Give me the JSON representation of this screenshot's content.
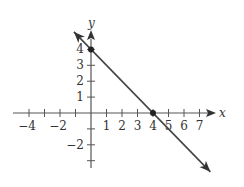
{
  "chart_data": {
    "type": "line",
    "title": "",
    "xlabel": "x",
    "ylabel": "y",
    "xlim": [
      -5.1,
      8
    ],
    "ylim": [
      -3.5,
      5.2
    ],
    "grid": false,
    "legend": "none",
    "x_ticks": [
      -4,
      -3,
      -2,
      -1,
      1,
      2,
      3,
      4,
      5,
      6,
      7
    ],
    "x_tick_labels": [
      {
        "value": -4,
        "label": "−4"
      },
      {
        "value": -2,
        "label": "−2"
      },
      {
        "value": 1,
        "label": "1"
      },
      {
        "value": 2,
        "label": "2"
      },
      {
        "value": 3,
        "label": "3"
      },
      {
        "value": 4,
        "label": "4"
      },
      {
        "value": 5,
        "label": "5"
      },
      {
        "value": 6,
        "label": "6"
      },
      {
        "value": 7,
        "label": "7"
      }
    ],
    "y_ticks": [
      -3,
      -2,
      -1,
      1,
      2,
      3,
      4
    ],
    "y_tick_labels": [
      {
        "value": 4,
        "label": "4"
      },
      {
        "value": 3,
        "label": "3"
      },
      {
        "value": 2,
        "label": "2"
      },
      {
        "value": 1,
        "label": "1"
      },
      {
        "value": -2,
        "label": "−2"
      }
    ],
    "series": [
      {
        "name": "line",
        "equation": "y = -x + 4",
        "x": [
          -1.1,
          7.7
        ],
        "y": [
          5.1,
          -3.7
        ],
        "arrows": "both"
      }
    ],
    "points": [
      {
        "x": 0,
        "y": 4,
        "label": "y-intercept"
      },
      {
        "x": 4,
        "y": 0,
        "label": "x-intercept"
      }
    ]
  }
}
